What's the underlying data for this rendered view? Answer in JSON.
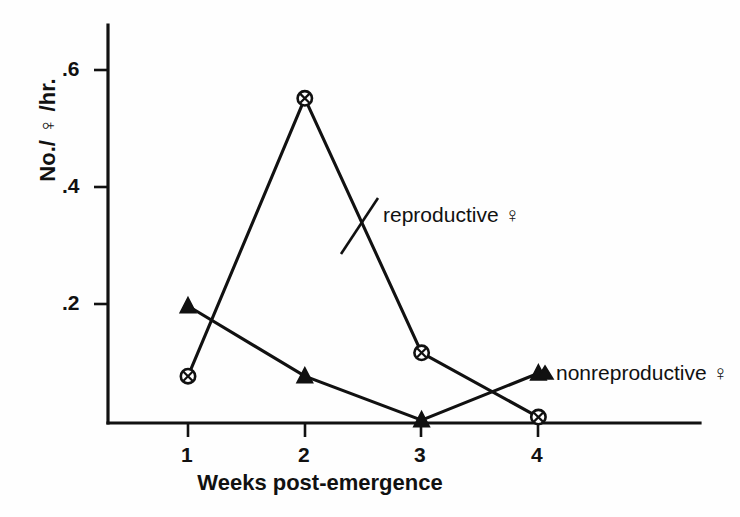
{
  "chart_data": {
    "type": "line",
    "title": "",
    "xlabel": "Weeks post-emergence",
    "ylabel": "No./ ♀ /hr.",
    "x": [
      1,
      2,
      3,
      4
    ],
    "xticklabels": [
      "1",
      "2",
      "3",
      "4"
    ],
    "yticklabels": [
      ".2",
      ".4",
      ".6"
    ],
    "ytickvalues": [
      0.2,
      0.4,
      0.6
    ],
    "xlim": [
      0.5,
      4.6
    ],
    "ylim": [
      0,
      0.68
    ],
    "grid": false,
    "legend_position": "inline-annotations",
    "series": [
      {
        "name": "reproductive ♀",
        "marker": "circle-with-cross",
        "values": [
          0.08,
          0.555,
          0.12,
          0.01
        ]
      },
      {
        "name": "nonreproductive ♀",
        "marker": "filled-triangle",
        "values": [
          0.2,
          0.08,
          0.005,
          0.085
        ]
      }
    ],
    "annotations": [
      {
        "text": "reproductive ♀",
        "series": "reproductive ♀"
      },
      {
        "text": "nonreproductive ♀",
        "series": "nonreproductive ♀"
      }
    ],
    "colors": {
      "ink": "#111111",
      "background": "#fefefe",
      "marker_fill": "#ffffff"
    }
  },
  "axes": {
    "y_ticks": [
      {
        "label": ".6",
        "value": 0.6
      },
      {
        "label": ".4",
        "value": 0.4
      },
      {
        "label": ".2",
        "value": 0.2
      }
    ],
    "x_ticks": [
      {
        "label": "1",
        "value": 1
      },
      {
        "label": "2",
        "value": 2
      },
      {
        "label": "3",
        "value": 3
      },
      {
        "label": "4",
        "value": 4
      }
    ],
    "y_title": "No./ ♀ /hr.",
    "x_title": "Weeks post-emergence"
  },
  "annotations": {
    "reproductive": "reproductive ♀",
    "nonreproductive": "nonreproductive ♀"
  }
}
